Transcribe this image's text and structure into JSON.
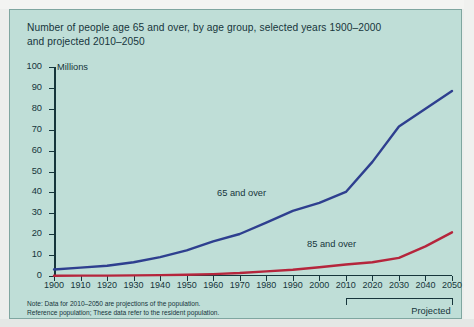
{
  "chart_data": {
    "type": "line",
    "title": "Number of people age 65 and over, by age group, selected years 1900–2000 and projected 2010–2050",
    "title_line_1": "Number of people age 65 and over, by age group, selected years 1900–2000",
    "title_line_2": "and projected 2010–2050",
    "ylabel": "Millions",
    "xlabel": "",
    "ylim": [
      0,
      100
    ],
    "xlim": [
      1900,
      2050
    ],
    "y_ticks": [
      0,
      10,
      20,
      30,
      40,
      50,
      60,
      70,
      80,
      90,
      100
    ],
    "y_tick_labels": [
      "0",
      "10",
      "20",
      "30",
      "40",
      "50",
      "60",
      "70",
      "80",
      "90",
      "100"
    ],
    "categories": [
      1900,
      1910,
      1920,
      1930,
      1940,
      1950,
      1960,
      1970,
      1980,
      1990,
      2000,
      2010,
      2020,
      2030,
      2040,
      2050
    ],
    "x_tick_labels": [
      "1900",
      "1910",
      "1920",
      "1930",
      "1940",
      "1950",
      "1960",
      "1970",
      "1980",
      "1990",
      "2000",
      "2010",
      "2020",
      "2030",
      "2040",
      "2050"
    ],
    "grid": false,
    "legend_position": "inline-annotations",
    "series": [
      {
        "name": "65 and over",
        "color": "#2e3f8f",
        "label_text": "65 and over",
        "values": [
          3.1,
          4.0,
          4.9,
          6.6,
          9.0,
          12.3,
          16.6,
          20.1,
          25.5,
          31.2,
          35.0,
          40.2,
          54.6,
          71.5,
          80.0,
          88.5
        ]
      },
      {
        "name": "85 and over",
        "color": "#b5253c",
        "label_text": "85 and over",
        "values": [
          0.1,
          0.2,
          0.2,
          0.3,
          0.4,
          0.6,
          0.9,
          1.4,
          2.2,
          3.0,
          4.2,
          5.5,
          6.6,
          8.7,
          14.2,
          20.9
        ]
      }
    ],
    "annotations": [
      {
        "text": "Projected",
        "x_from": 2010,
        "x_to": 2050,
        "type": "bracket"
      }
    ],
    "notes": [
      "Note: Data for 2010–2050 are projections of the population.",
      "Reference population; These data refer to the resident population."
    ],
    "note_line_1": "Note: Data for 2010–2050 are projections of the population.",
    "note_line_2": "Reference population; These data refer to the resident population."
  },
  "colors": {
    "panel_background": "#bfded7",
    "page_background": "#eceeec",
    "axis": "#16353b",
    "text": "#16353b",
    "series_65": "#2e3f8f",
    "series_85": "#b5253c"
  }
}
